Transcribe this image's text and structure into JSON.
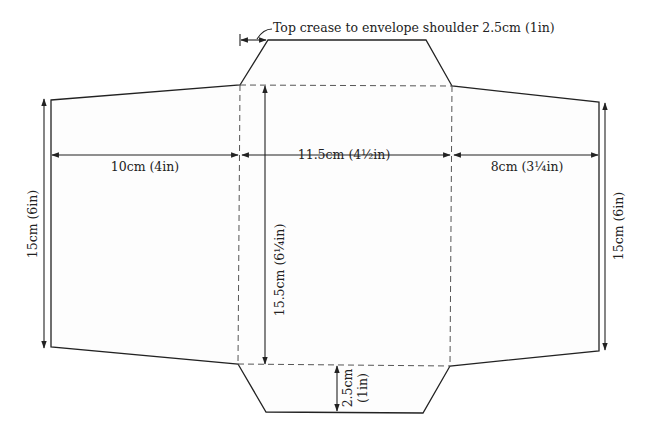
{
  "diagram": {
    "type": "envelope-template",
    "annotations": {
      "top_crease": "Top crease to envelope shoulder 2.5cm (1in)",
      "left_width": "10cm (4in)",
      "center_width": "11.5cm (4½in)",
      "right_width": "8cm (3¼in)",
      "left_height": "15cm (6in)",
      "right_height": "15cm (6in)",
      "center_height": "15.5cm (6¼in)",
      "bottom_flap_cm": "2.5cm",
      "bottom_flap_in": "(1in)"
    },
    "colors": {
      "outline": "#222222",
      "fold_line": "#555555",
      "paper": "#fdfdfd",
      "background": "#ffffff"
    }
  }
}
